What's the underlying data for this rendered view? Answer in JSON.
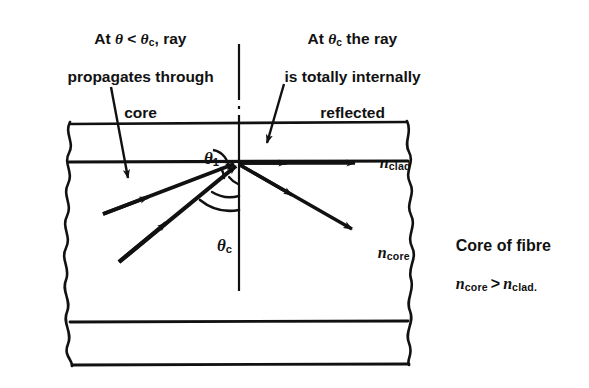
{
  "figure": {
    "type": "physics-ray-diagram",
    "background_color": "#ffffff",
    "ink_color": "#111111"
  },
  "annotations": {
    "left_note": {
      "line1_prefix": "At ",
      "line1_theta": "θ",
      "line1_mid": " < ",
      "line1_theta2": "θ",
      "line1_sub": "c",
      "line1_suffix": ", ray",
      "line2": "propagates through",
      "line3": "core",
      "full_text": "At θ < θc, ray propagates through core"
    },
    "right_note": {
      "line1_prefix": "At ",
      "line1_theta": "θ",
      "line1_sub": "c",
      "line1_suffix": " the ray",
      "line2": "is totally internally",
      "line3": "reflected",
      "full_text": "At θc the ray is totally internally reflected"
    },
    "side_note": {
      "line1": "Core of fibre",
      "n_symbol": "n",
      "sub_core": "core",
      "relation": ">",
      "sub_clad": "clad.",
      "full_text": "Core of fibre  n_core > n_clad."
    }
  },
  "labels": {
    "theta_one": {
      "symbol": "θ",
      "subscript": "1"
    },
    "theta_c": {
      "symbol": "θ",
      "subscript": "c"
    },
    "n_clad": {
      "symbol": "n",
      "subscript": "clad"
    },
    "n_core": {
      "symbol": "n",
      "subscript": "core"
    }
  },
  "regions": [
    {
      "name": "upper-cladding",
      "label": "n_clad"
    },
    {
      "name": "core",
      "label": "n_core"
    },
    {
      "name": "lower-cladding",
      "label": ""
    }
  ],
  "rays": [
    {
      "name": "shallow-incident-ray",
      "direction": "up-right",
      "arrowheads": 1,
      "description": "ray at theta less than critical, refracts/propagates through core"
    },
    {
      "name": "steep-incident-ray",
      "direction": "up-right",
      "arrowheads": 1,
      "description": "ray arriving at critical angle"
    },
    {
      "name": "totally-reflected-ray",
      "direction": "right-along-interface",
      "arrowheads": 2,
      "description": "ray travelling along core-cladding boundary"
    },
    {
      "name": "transmitted-ray",
      "direction": "down-right",
      "arrowheads": 1,
      "description": "ray propagating through core"
    },
    {
      "name": "normal-line",
      "direction": "vertical",
      "style": "dash-dot",
      "description": "normal to the core-cladding interface"
    }
  ],
  "leaders": [
    {
      "name": "left-note-leader",
      "from": "left note",
      "to": "core region"
    },
    {
      "name": "right-note-leader",
      "from": "right note",
      "to": "interface point"
    },
    {
      "name": "theta-one-leader",
      "from": "theta 1 label",
      "to": "angle vertex"
    }
  ]
}
